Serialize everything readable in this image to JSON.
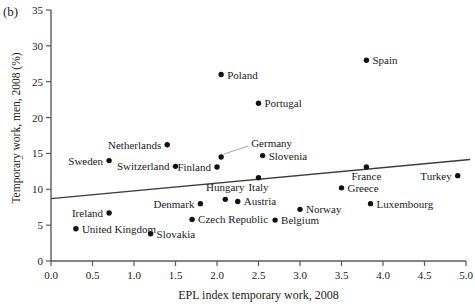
{
  "figure": {
    "panel_label": "(b)"
  },
  "chart_data": {
    "type": "scatter",
    "title": "",
    "xlabel": "EPL index temporary work, 2008",
    "ylabel": "Temporary work, men, 2008 (%)",
    "xlim": [
      0.0,
      5.0
    ],
    "ylim": [
      0,
      35
    ],
    "xticks": [
      "0.0",
      "0.5",
      "1.0",
      "1.5",
      "2.0",
      "2.5",
      "3.0",
      "3.5",
      "4.0",
      "4.5",
      "5.0"
    ],
    "xtick_values": [
      0.0,
      0.5,
      1.0,
      1.5,
      2.0,
      2.5,
      3.0,
      3.5,
      4.0,
      4.5,
      5.0
    ],
    "yticks": [
      "0",
      "5",
      "10",
      "15",
      "20",
      "25",
      "30",
      "35"
    ],
    "ytick_values": [
      0,
      5,
      10,
      15,
      20,
      25,
      30,
      35
    ],
    "grid": false,
    "legend": false,
    "points": [
      {
        "name": "United Kingdom",
        "x": 0.3,
        "y": 4.5,
        "label_pos": "right"
      },
      {
        "name": "Ireland",
        "x": 0.7,
        "y": 6.7,
        "label_pos": "left"
      },
      {
        "name": "Sweden",
        "x": 0.7,
        "y": 14.0,
        "label_pos": "left"
      },
      {
        "name": "Slovakia",
        "x": 1.2,
        "y": 3.8,
        "label_pos": "right"
      },
      {
        "name": "Netherlands",
        "x": 1.4,
        "y": 16.2,
        "label_pos": "left"
      },
      {
        "name": "Switzerland",
        "x": 1.5,
        "y": 13.2,
        "label_pos": "left"
      },
      {
        "name": "Denmark",
        "x": 1.8,
        "y": 8.0,
        "label_pos": "left"
      },
      {
        "name": "Czech Republic",
        "x": 1.7,
        "y": 5.8,
        "label_pos": "right"
      },
      {
        "name": "Finland",
        "x": 2.0,
        "y": 13.1,
        "label_pos": "left"
      },
      {
        "name": "Germany",
        "x": 2.05,
        "y": 14.5,
        "label_pos": "leader"
      },
      {
        "name": "Hungary",
        "x": 2.1,
        "y": 8.6,
        "label_pos": "above"
      },
      {
        "name": "Poland",
        "x": 2.05,
        "y": 26.0,
        "label_pos": "right"
      },
      {
        "name": "Austria",
        "x": 2.25,
        "y": 8.3,
        "label_pos": "right"
      },
      {
        "name": "Italy",
        "x": 2.5,
        "y": 11.6,
        "label_pos": "below"
      },
      {
        "name": "Portugal",
        "x": 2.5,
        "y": 22.0,
        "label_pos": "right"
      },
      {
        "name": "Slovenia",
        "x": 2.55,
        "y": 14.7,
        "label_pos": "right"
      },
      {
        "name": "Belgium",
        "x": 2.7,
        "y": 5.7,
        "label_pos": "right"
      },
      {
        "name": "Norway",
        "x": 3.0,
        "y": 7.2,
        "label_pos": "right"
      },
      {
        "name": "Greece",
        "x": 3.5,
        "y": 10.2,
        "label_pos": "right"
      },
      {
        "name": "France",
        "x": 3.8,
        "y": 13.1,
        "label_pos": "below"
      },
      {
        "name": "Spain",
        "x": 3.8,
        "y": 28.0,
        "label_pos": "right"
      },
      {
        "name": "Luxembourg",
        "x": 3.85,
        "y": 8.0,
        "label_pos": "right"
      },
      {
        "name": "Turkey",
        "x": 4.9,
        "y": 11.9,
        "label_pos": "left"
      }
    ],
    "trendline": {
      "x1": 0.0,
      "y1": 8.7,
      "x2": 5.05,
      "y2": 14.15
    }
  }
}
